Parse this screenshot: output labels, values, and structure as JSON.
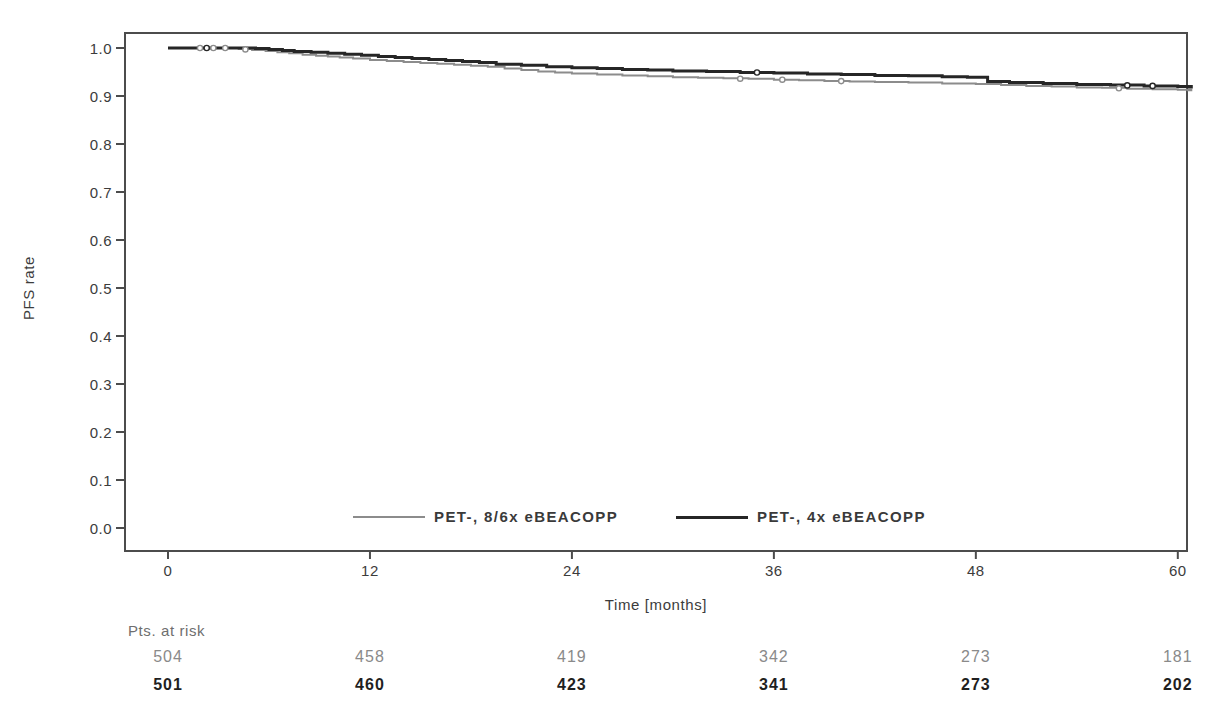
{
  "chart_data": {
    "type": "line",
    "subtype": "kaplan_meier_step",
    "title": "",
    "xlabel": "Time [months]",
    "ylabel": "PFS rate",
    "x_tick_values": [
      0,
      12,
      24,
      36,
      48,
      60
    ],
    "x_tick_labels": [
      "0",
      "12",
      "24",
      "36",
      "48",
      "60"
    ],
    "y_tick_values": [
      0.0,
      0.1,
      0.2,
      0.3,
      0.4,
      0.5,
      0.6,
      0.7,
      0.8,
      0.9,
      1.0
    ],
    "y_tick_labels": [
      "0.0",
      "0.1",
      "0.2",
      "0.3",
      "0.4",
      "0.5",
      "0.6",
      "0.7",
      "0.8",
      "0.9",
      "1.0"
    ],
    "xlim": [
      -2.6,
      60.6
    ],
    "ylim": [
      -0.05,
      1.03
    ],
    "grid": false,
    "legend_position": "bottom-center-inside",
    "axis_color": "#4c4c4c",
    "tick_text_color": "#3c3c3c",
    "series": [
      {
        "name": "PET-, 8/6x eBEACOPP",
        "color": "#8c8c8c",
        "width": 2,
        "points": [
          [
            0,
            1.0
          ],
          [
            3.5,
            1.0
          ],
          [
            4.2,
            0.998
          ],
          [
            5,
            0.996
          ],
          [
            5.8,
            0.994
          ],
          [
            6.5,
            0.991
          ],
          [
            7.2,
            0.989
          ],
          [
            8,
            0.986
          ],
          [
            8.8,
            0.984
          ],
          [
            9.5,
            0.982
          ],
          [
            10.2,
            0.98
          ],
          [
            11,
            0.978
          ],
          [
            12,
            0.975
          ],
          [
            13,
            0.973
          ],
          [
            14,
            0.971
          ],
          [
            15,
            0.969
          ],
          [
            16,
            0.967
          ],
          [
            17,
            0.965
          ],
          [
            18,
            0.963
          ],
          [
            19,
            0.961
          ],
          [
            20,
            0.957
          ],
          [
            21,
            0.954
          ],
          [
            22,
            0.951
          ],
          [
            23,
            0.949
          ],
          [
            24,
            0.947
          ],
          [
            25.5,
            0.945
          ],
          [
            27,
            0.943
          ],
          [
            28.5,
            0.941
          ],
          [
            30,
            0.939
          ],
          [
            31.5,
            0.938
          ],
          [
            33,
            0.937
          ],
          [
            34.5,
            0.936
          ],
          [
            36,
            0.934
          ],
          [
            37.5,
            0.933
          ],
          [
            39,
            0.931
          ],
          [
            40.5,
            0.93
          ],
          [
            42,
            0.929
          ],
          [
            44,
            0.928
          ],
          [
            46,
            0.926
          ],
          [
            48,
            0.925
          ],
          [
            49.5,
            0.923
          ],
          [
            51,
            0.921
          ],
          [
            52.5,
            0.92
          ],
          [
            54,
            0.918
          ],
          [
            55.5,
            0.917
          ],
          [
            57,
            0.915
          ],
          [
            58.5,
            0.914
          ],
          [
            60,
            0.913
          ],
          [
            60.8,
            0.912
          ]
        ],
        "censor_marks": [
          [
            1.9,
            1.0
          ],
          [
            2.7,
            1.0
          ],
          [
            3.4,
            1.0
          ],
          [
            4.6,
            0.997
          ],
          [
            34,
            0.936
          ],
          [
            36.5,
            0.934
          ],
          [
            40,
            0.931
          ],
          [
            56.5,
            0.916
          ]
        ]
      },
      {
        "name": "PET-, 4x eBEACOPP",
        "color": "#262626",
        "width": 3,
        "points": [
          [
            0,
            1.0
          ],
          [
            4.5,
            1.0
          ],
          [
            5.2,
            0.999
          ],
          [
            6,
            0.997
          ],
          [
            6.8,
            0.995
          ],
          [
            7.5,
            0.993
          ],
          [
            8.5,
            0.991
          ],
          [
            9.5,
            0.989
          ],
          [
            10.5,
            0.987
          ],
          [
            11.5,
            0.985
          ],
          [
            12.5,
            0.982
          ],
          [
            13.5,
            0.98
          ],
          [
            14.5,
            0.978
          ],
          [
            15.5,
            0.976
          ],
          [
            16.5,
            0.974
          ],
          [
            17.5,
            0.972
          ],
          [
            18.5,
            0.97
          ],
          [
            19.5,
            0.966
          ],
          [
            21,
            0.964
          ],
          [
            22.5,
            0.961
          ],
          [
            24,
            0.959
          ],
          [
            25.5,
            0.957
          ],
          [
            27,
            0.955
          ],
          [
            28.5,
            0.954
          ],
          [
            30,
            0.952
          ],
          [
            32,
            0.951
          ],
          [
            34,
            0.949
          ],
          [
            36,
            0.948
          ],
          [
            38,
            0.946
          ],
          [
            40,
            0.945
          ],
          [
            42,
            0.943
          ],
          [
            44,
            0.942
          ],
          [
            46,
            0.94
          ],
          [
            47.5,
            0.939
          ],
          [
            48.7,
            0.93
          ],
          [
            50,
            0.928
          ],
          [
            52,
            0.926
          ],
          [
            54,
            0.924
          ],
          [
            56,
            0.923
          ],
          [
            58,
            0.921
          ],
          [
            60,
            0.92
          ],
          [
            60.8,
            0.919
          ]
        ],
        "censor_marks": [
          [
            2.3,
            1.0
          ],
          [
            35,
            0.949
          ],
          [
            57,
            0.922
          ],
          [
            58.5,
            0.921
          ]
        ]
      }
    ],
    "risk_table": {
      "title": "Pts. at risk",
      "time_points": [
        0,
        12,
        24,
        36,
        48,
        60
      ],
      "rows": [
        {
          "series": "PET-, 8/6x eBEACOPP",
          "values": [
            "504",
            "458",
            "419",
            "342",
            "273",
            "181"
          ],
          "color": "#8a8a8a",
          "bold": false
        },
        {
          "series": "PET-, 4x eBEACOPP",
          "values": [
            "501",
            "460",
            "423",
            "341",
            "273",
            "202"
          ],
          "color": "#1f1f1f",
          "bold": true
        }
      ]
    }
  }
}
